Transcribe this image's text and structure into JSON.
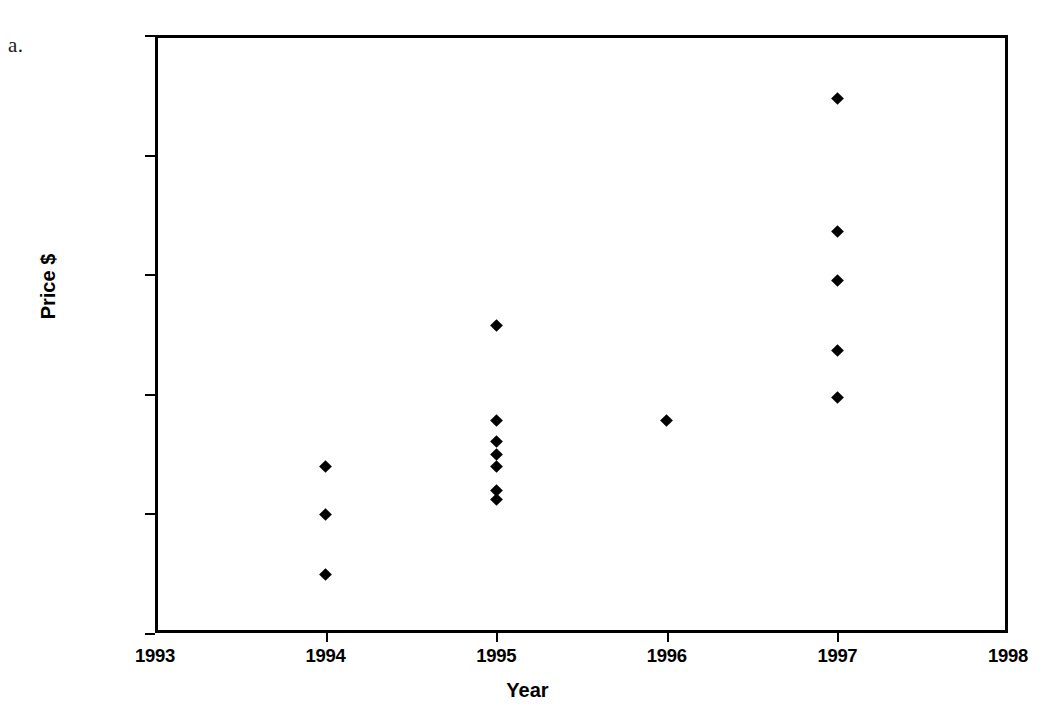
{
  "figure": {
    "label": "a."
  },
  "chart_data": {
    "type": "scatter",
    "title": "",
    "xlabel": "Year",
    "ylabel": "Price $",
    "xlim": [
      1993,
      1998
    ],
    "ylim": [
      10000,
      35000
    ],
    "xticks": [
      1993,
      1994,
      1995,
      1996,
      1997,
      1998
    ],
    "xtick_labels": [
      "1993",
      "1994",
      "1995",
      "1996",
      "1997",
      "1998"
    ],
    "yticks": [
      10000,
      15000,
      20000,
      25000,
      30000,
      35000
    ],
    "ytick_labels": [
      "10000",
      "15000",
      "20000",
      "25000",
      "30000",
      "35000"
    ],
    "grid": false,
    "legend": null,
    "marker": "diamond",
    "marker_color": "#000000",
    "series": [
      {
        "name": "Price",
        "points": [
          {
            "x": 1994,
            "y": 16950
          },
          {
            "x": 1994,
            "y": 14950
          },
          {
            "x": 1994,
            "y": 12450
          },
          {
            "x": 1995,
            "y": 22850
          },
          {
            "x": 1995,
            "y": 18900
          },
          {
            "x": 1995,
            "y": 18000
          },
          {
            "x": 1995,
            "y": 17450
          },
          {
            "x": 1995,
            "y": 16950
          },
          {
            "x": 1995,
            "y": 15950
          },
          {
            "x": 1995,
            "y": 15600
          },
          {
            "x": 1996,
            "y": 18900
          },
          {
            "x": 1997,
            "y": 32350
          },
          {
            "x": 1997,
            "y": 26800
          },
          {
            "x": 1997,
            "y": 24750
          },
          {
            "x": 1997,
            "y": 21800
          },
          {
            "x": 1997,
            "y": 19850
          }
        ]
      }
    ]
  }
}
